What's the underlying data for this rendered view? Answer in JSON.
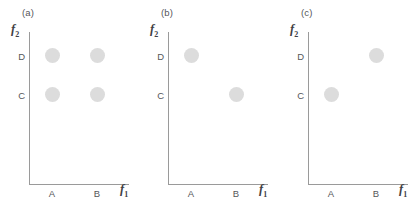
{
  "figure": {
    "background_color": "#ffffff",
    "axis_color": "#9a9a9a",
    "text_color": "#55565a",
    "marker_color": "#dcdcdc"
  },
  "panels": [
    {
      "id": "a",
      "label": "(a)",
      "xlabel": "f",
      "xlabel_sub": "1",
      "ylabel": "f",
      "ylabel_sub": "2",
      "xticks": [
        "A",
        "B"
      ],
      "yticks": [
        "D",
        "C"
      ],
      "points": [
        {
          "x": "A",
          "y": "D"
        },
        {
          "x": "B",
          "y": "D"
        },
        {
          "x": "A",
          "y": "C"
        },
        {
          "x": "B",
          "y": "C"
        }
      ]
    },
    {
      "id": "b",
      "label": "(b)",
      "xlabel": "f",
      "xlabel_sub": "1",
      "ylabel": "f",
      "ylabel_sub": "2",
      "xticks": [
        "A",
        "B"
      ],
      "yticks": [
        "D",
        "C"
      ],
      "points": [
        {
          "x": "A",
          "y": "D"
        },
        {
          "x": "B",
          "y": "C"
        }
      ]
    },
    {
      "id": "c",
      "label": "(c)",
      "xlabel": "f",
      "xlabel_sub": "1",
      "ylabel": "f",
      "ylabel_sub": "2",
      "xticks": [
        "A",
        "B"
      ],
      "yticks": [
        "D",
        "C"
      ],
      "points": [
        {
          "x": "A",
          "y": "C"
        },
        {
          "x": "B",
          "y": "D"
        }
      ]
    }
  ],
  "chart_data": [
    {
      "type": "scatter",
      "title": "(a)",
      "xlabel": "f1",
      "ylabel": "f2",
      "x_categories": [
        "A",
        "B"
      ],
      "y_categories": [
        "C",
        "D"
      ],
      "points": [
        [
          "A",
          "D"
        ],
        [
          "B",
          "D"
        ],
        [
          "A",
          "C"
        ],
        [
          "B",
          "C"
        ]
      ],
      "grid": false,
      "legend": null,
      "marker_color": "#dcdcdc"
    },
    {
      "type": "scatter",
      "title": "(b)",
      "xlabel": "f1",
      "ylabel": "f2",
      "x_categories": [
        "A",
        "B"
      ],
      "y_categories": [
        "C",
        "D"
      ],
      "points": [
        [
          "A",
          "D"
        ],
        [
          "B",
          "C"
        ]
      ],
      "grid": false,
      "legend": null,
      "marker_color": "#dcdcdc"
    },
    {
      "type": "scatter",
      "title": "(c)",
      "xlabel": "f1",
      "ylabel": "f2",
      "x_categories": [
        "A",
        "B"
      ],
      "y_categories": [
        "C",
        "D"
      ],
      "points": [
        [
          "A",
          "C"
        ],
        [
          "B",
          "D"
        ]
      ],
      "grid": false,
      "legend": null,
      "marker_color": "#dcdcdc"
    }
  ]
}
